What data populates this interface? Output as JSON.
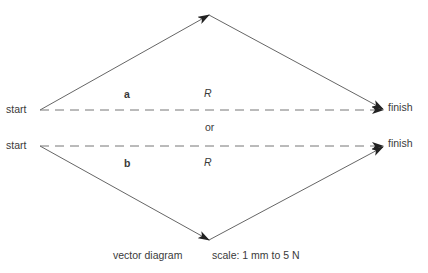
{
  "diagram": {
    "type": "vector-addition",
    "top": {
      "start_label": "start",
      "finish_label": "finish",
      "vector_label": "a",
      "resultant_label": "R"
    },
    "separator_label": "or",
    "bottom": {
      "start_label": "start",
      "finish_label": "finish",
      "vector_label": "b",
      "resultant_label": "R"
    },
    "caption": "vector diagram",
    "scale": "scale: 1 mm to 5 N",
    "colors": {
      "line": "#555555",
      "arrow": "#222222",
      "text": "#3a3a3a"
    }
  }
}
